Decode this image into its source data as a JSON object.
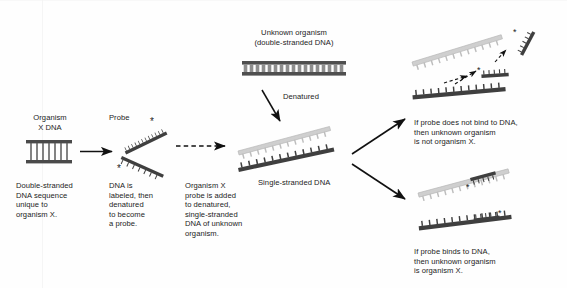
{
  "diagram": {
    "background_color": "#fefefe",
    "text_color": "#1c1c1c",
    "labels": {
      "organism_x_dna": "Organism\nX DNA",
      "probe": "Probe",
      "unknown_organism": "Unknown organism\n(double-stranded DNA)",
      "denatured": "Denatured",
      "single_stranded_dna": "Single-stranded DNA",
      "caption_organism_x": "Double-stranded\nDNA sequence\nunique to\norganism X.",
      "caption_probe": "DNA is\nlabeled, then\ndenatured\nto become\na probe.",
      "caption_mixing": "Organism X\nprobe is added\nto denatured,\nsingle-stranded\nDNA of unknown\norganism.",
      "result_negative": "If probe does not bind to DNA,\nthen unknown organism\nis not organism X.",
      "result_positive": "If probe binds to DNA,\nthen unknown organism\nis organism X."
    },
    "colors": {
      "dna_dark": "#4a4a4a",
      "dna_darker": "#3b3b3b",
      "dna_light": "#b9b9b9",
      "dna_light_fill": "#d4d4d4",
      "arrow": "#111111",
      "label_star": "#222222"
    },
    "elements": [
      {
        "name": "organism-x-double-strand",
        "kind": "double-stranded-dna",
        "rungs": 7
      },
      {
        "name": "probe-upper-strand",
        "kind": "single-stranded-probe",
        "label_star": true
      },
      {
        "name": "probe-lower-strand",
        "kind": "single-stranded-probe",
        "label_star": true
      },
      {
        "name": "unknown-organism-double-strand",
        "kind": "double-stranded-dna",
        "rungs": 17
      },
      {
        "name": "denatured-upper-strand",
        "kind": "single-stranded-dna",
        "shade": "light"
      },
      {
        "name": "denatured-lower-strand",
        "kind": "single-stranded-dna",
        "shade": "dark"
      },
      {
        "name": "negative-upper-strand",
        "kind": "single-stranded-dna",
        "shade": "light"
      },
      {
        "name": "negative-lower-strand",
        "kind": "single-stranded-dna",
        "shade": "dark"
      },
      {
        "name": "negative-free-probe-1",
        "kind": "unbound-probe",
        "label_star": true
      },
      {
        "name": "negative-free-probe-2",
        "kind": "unbound-probe",
        "label_star": true
      },
      {
        "name": "positive-upper-strand",
        "kind": "single-stranded-dna",
        "shade": "light"
      },
      {
        "name": "positive-lower-strand",
        "kind": "single-stranded-dna",
        "shade": "dark"
      },
      {
        "name": "positive-bound-probe-1",
        "kind": "bound-probe",
        "label_star": true
      },
      {
        "name": "positive-bound-probe-2",
        "kind": "bound-probe",
        "label_star": true
      }
    ],
    "arrows": [
      {
        "name": "arrow-organism-to-probe",
        "style": "solid"
      },
      {
        "name": "arrow-probe-to-mixture",
        "style": "dashed"
      },
      {
        "name": "arrow-denatured",
        "style": "solid"
      },
      {
        "name": "arrow-to-negative-result",
        "style": "solid"
      },
      {
        "name": "arrow-to-positive-result",
        "style": "solid"
      },
      {
        "name": "arrow-probe-rebound-1",
        "style": "dashed"
      },
      {
        "name": "arrow-probe-rebound-2",
        "style": "dashed"
      }
    ]
  }
}
